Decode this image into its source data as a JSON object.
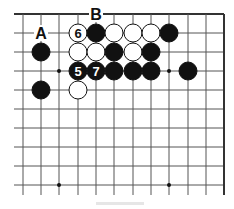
{
  "diagram": {
    "type": "go-board-fragment",
    "cols_x": [
      23,
      41,
      59,
      78,
      96,
      114,
      133,
      151,
      169,
      188,
      206,
      224
    ],
    "rows_y": [
      14,
      33,
      52,
      71,
      90,
      109,
      128,
      147,
      166,
      185
    ],
    "top_edge": true,
    "right_edge": true,
    "line_bottom": 195,
    "line_left_extent": 14,
    "stone_radius": 9,
    "colors": {
      "line": "#555555",
      "edge": "#333333",
      "black": "#111111",
      "white": "#ffffff",
      "hoshi": "#111111"
    },
    "hoshi": [
      {
        "c": 2,
        "r": 3
      },
      {
        "c": 8,
        "r": 3
      },
      {
        "c": 2,
        "r": 9
      },
      {
        "c": 8,
        "r": 9
      }
    ],
    "stones": [
      {
        "c": 3,
        "r": 1,
        "color": "white",
        "label": "6"
      },
      {
        "c": 4,
        "r": 1,
        "color": "black",
        "label": ""
      },
      {
        "c": 5,
        "r": 1,
        "color": "white",
        "label": ""
      },
      {
        "c": 6,
        "r": 1,
        "color": "white",
        "label": ""
      },
      {
        "c": 7,
        "r": 1,
        "color": "white",
        "label": ""
      },
      {
        "c": 8,
        "r": 1,
        "color": "black",
        "label": ""
      },
      {
        "c": 1,
        "r": 2,
        "color": "black",
        "label": ""
      },
      {
        "c": 3,
        "r": 2,
        "color": "white",
        "label": ""
      },
      {
        "c": 4,
        "r": 2,
        "color": "white",
        "label": ""
      },
      {
        "c": 5,
        "r": 2,
        "color": "black",
        "label": ""
      },
      {
        "c": 6,
        "r": 2,
        "color": "white",
        "label": ""
      },
      {
        "c": 7,
        "r": 2,
        "color": "black",
        "label": ""
      },
      {
        "c": 3,
        "r": 3,
        "color": "black",
        "label": "5"
      },
      {
        "c": 4,
        "r": 3,
        "color": "black",
        "label": "7"
      },
      {
        "c": 5,
        "r": 3,
        "color": "black",
        "label": ""
      },
      {
        "c": 6,
        "r": 3,
        "color": "black",
        "label": ""
      },
      {
        "c": 7,
        "r": 3,
        "color": "black",
        "label": ""
      },
      {
        "c": 9,
        "r": 3,
        "color": "black",
        "label": ""
      },
      {
        "c": 1,
        "r": 4,
        "color": "black",
        "label": ""
      },
      {
        "c": 3,
        "r": 4,
        "color": "white",
        "label": ""
      }
    ],
    "point_labels": [
      {
        "c": 1,
        "r": 1,
        "text": "A"
      },
      {
        "c": 4,
        "r": 0,
        "text": "B"
      }
    ]
  },
  "caption": {
    "text": ""
  }
}
